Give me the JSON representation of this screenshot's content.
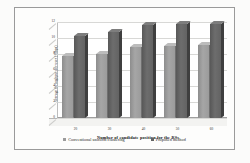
{
  "chart_data": {
    "type": "bar",
    "title": "",
    "xlabel": "Number of candidate position for the RSs",
    "ylabel": "Average throughput per user (Mbps)",
    "categories": [
      "20",
      "30",
      "40",
      "50",
      "60"
    ],
    "ylim": [
      0,
      12
    ],
    "yticks": [
      "0",
      "2",
      "4",
      "6",
      "8",
      "10",
      "12"
    ],
    "grid": true,
    "legend_position": "bottom",
    "series": [
      {
        "name": "Conventional uniform clustering",
        "color": "#9b9b9b",
        "values": [
          7.8,
          8.0,
          8.9,
          9.0,
          9.1
        ]
      },
      {
        "name": "Proposed method",
        "color": "#636363",
        "values": [
          10.2,
          10.8,
          11.6,
          11.7,
          11.7
        ]
      }
    ]
  },
  "legend": {
    "items": [
      {
        "label": "Conventional uniform clustering",
        "marker": "square-marker"
      },
      {
        "label": "Proposed method",
        "marker": "square-marker"
      }
    ]
  }
}
